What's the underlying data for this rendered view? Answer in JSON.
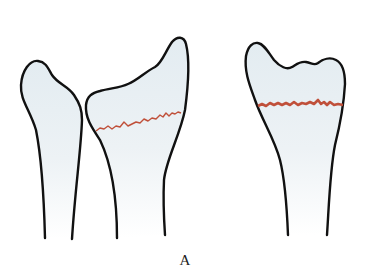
{
  "figure": {
    "caption": "A",
    "colors": {
      "outline": "#111111",
      "bone_fill": "#e6eef2",
      "fracture_line": "#c0503a",
      "background": "#ffffff"
    },
    "elements": [
      {
        "name": "ulna",
        "description": "left bone, distal end, intact"
      },
      {
        "name": "radius-lateral-view",
        "description": "middle bone, distal end with transverse fracture line"
      },
      {
        "name": "radius-ap-view",
        "description": "right bone, distal end with transverse fracture line"
      }
    ]
  }
}
